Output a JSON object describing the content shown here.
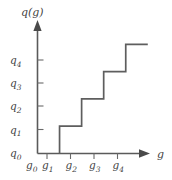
{
  "chart_data": {
    "type": "line",
    "title": "",
    "subtitle": "",
    "xlabel": "g",
    "ylabel": "q(g)",
    "grid": false,
    "legend": null,
    "annotations": [],
    "x_tick_labels": [
      "g0",
      "g1",
      "g2",
      "g3",
      "g4"
    ],
    "y_tick_labels": [
      "q0",
      "q1",
      "q2",
      "q3",
      "q4"
    ],
    "x_tick_values": [
      0,
      1,
      2,
      3,
      4
    ],
    "y_tick_values": [
      0,
      1,
      2,
      3,
      4
    ],
    "xlim": [
      0,
      5.1
    ],
    "ylim": [
      0,
      4.6
    ],
    "series": [
      {
        "name": "q(g)",
        "kind": "step-post",
        "x": [
          1,
          1,
          2,
          2,
          3,
          3,
          4,
          4,
          5.0
        ],
        "y": [
          0,
          1,
          1,
          2,
          2,
          3,
          3,
          4,
          4
        ],
        "color": "#5e5e5e"
      }
    ],
    "steps": [
      {
        "from_x": 1,
        "to_x": 2,
        "level_label": "q1",
        "level_value": 1
      },
      {
        "from_x": 2,
        "to_x": 3,
        "level_label": "q2",
        "level_value": 2
      },
      {
        "from_x": 3,
        "to_x": 4,
        "level_label": "q3",
        "level_value": 3
      },
      {
        "from_x": 4,
        "to_x": 5.0,
        "level_label": "q4",
        "level_value": 4
      }
    ]
  },
  "axes": {
    "y_title_base": "q",
    "y_title_arg": "(g)",
    "x_title": "g"
  },
  "y_ticks": [
    {
      "base": "q",
      "sub": "0"
    },
    {
      "base": "q",
      "sub": "1"
    },
    {
      "base": "q",
      "sub": "2"
    },
    {
      "base": "q",
      "sub": "3"
    },
    {
      "base": "q",
      "sub": "4"
    }
  ],
  "x_ticks": [
    {
      "base": "g",
      "sub": "0"
    },
    {
      "base": "g",
      "sub": "1"
    },
    {
      "base": "g",
      "sub": "2"
    },
    {
      "base": "g",
      "sub": "3"
    },
    {
      "base": "g",
      "sub": "4"
    }
  ],
  "colors": {
    "background": "#ffffff",
    "axis": "#5a5a5a",
    "curve": "#5e5e5e",
    "text": "#3f3f3f",
    "tick": "#6a6a6a"
  }
}
